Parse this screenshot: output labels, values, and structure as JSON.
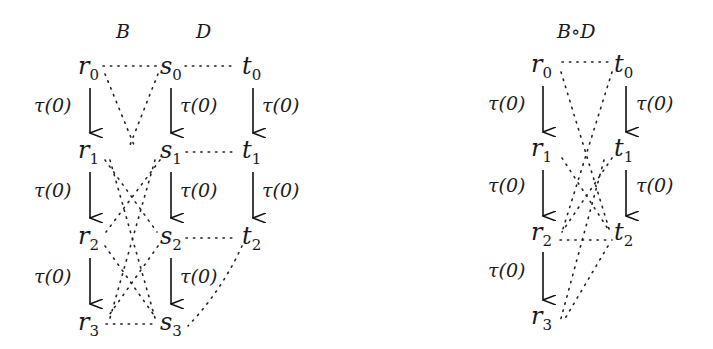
{
  "left_diagram": {
    "titles": {
      "b": "B",
      "d": "D"
    },
    "nodes": {
      "r": [
        "r",
        "0",
        "1",
        "2",
        "3"
      ],
      "s": [
        "s",
        "0",
        "1",
        "2",
        "3"
      ],
      "t": [
        "t",
        "0",
        "1",
        "2"
      ]
    },
    "transition_label": "τ(0)",
    "relations": [
      "r0-s0",
      "s0-t0",
      "s1-t1",
      "s2-t2",
      "r3-s3",
      "r0-s1",
      "s0-r1",
      "r1-s2",
      "s1-r2",
      "r1-s3",
      "s1-r3",
      "r2-s3",
      "s2-r3",
      "t2-s3"
    ]
  },
  "right_diagram": {
    "title": "B∘D",
    "nodes": {
      "r": [
        "r",
        "0",
        "1",
        "2",
        "3"
      ],
      "t": [
        "t",
        "0",
        "1",
        "2"
      ]
    },
    "transition_label": "τ(0)",
    "relations": [
      "r0-t0",
      "r0-t2",
      "t0-r2",
      "r1-t2",
      "t1-r2",
      "r2-t2",
      "t1-r3",
      "t2-r3"
    ]
  },
  "labels": {
    "B": "B",
    "D": "D",
    "BD": "B∘D",
    "r": "r",
    "s": "s",
    "t": "t",
    "i0": "0",
    "i1": "1",
    "i2": "2",
    "i3": "3",
    "tau": "τ(0)"
  }
}
